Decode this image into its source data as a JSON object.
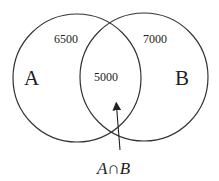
{
  "diagram": {
    "type": "venn",
    "sets": [
      {
        "label": "A",
        "only_value": "6500"
      },
      {
        "label": "B",
        "only_value": "7000"
      }
    ],
    "intersection": {
      "value": "5000",
      "label": "A∩B"
    },
    "stroke_color": "#333333"
  }
}
